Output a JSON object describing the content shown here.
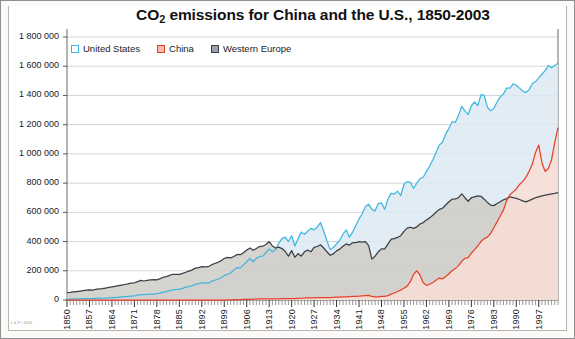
{
  "chart": {
    "title_main": "CO",
    "title_sub": "2",
    "title_rest": " emissions for China and the U.S., 1850-2003",
    "credit": "L & P / 2003"
  },
  "legend": {
    "items": [
      {
        "label": "United States",
        "color": "#3fb6e0",
        "key": "united-states"
      },
      {
        "label": "China",
        "color": "#e8412a",
        "key": "china"
      },
      {
        "label": "Western Europe",
        "color": "#3a3f46",
        "key": "western-europe"
      }
    ]
  },
  "axes": {
    "y_ticks": [
      "0",
      "200 000",
      "400 000",
      "600 000",
      "800 000",
      "1 000 000",
      "1 200 000",
      "1 400 000",
      "1 600 000",
      "1 800 000"
    ],
    "x_ticks": [
      "1850",
      "1857",
      "1864",
      "1871",
      "1878",
      "1885",
      "1892",
      "1899",
      "1906",
      "1913",
      "1920",
      "1927",
      "1934",
      "1941",
      "1948",
      "1955",
      "1962",
      "1969",
      "1976",
      "1983",
      "1990",
      "1997"
    ]
  },
  "chart_data": {
    "type": "area",
    "title": "CO2 emissions for China and the U.S., 1850-2003",
    "xlabel": "",
    "ylabel": "",
    "xlim": [
      1850,
      2003
    ],
    "ylim": [
      0,
      1800000
    ],
    "ytick_step": 200000,
    "xtick_step": 7,
    "grid": true,
    "legend_position": "top-left",
    "x": [
      1850,
      1851,
      1852,
      1853,
      1854,
      1855,
      1856,
      1857,
      1858,
      1859,
      1860,
      1861,
      1862,
      1863,
      1864,
      1865,
      1866,
      1867,
      1868,
      1869,
      1870,
      1871,
      1872,
      1873,
      1874,
      1875,
      1876,
      1877,
      1878,
      1879,
      1880,
      1881,
      1882,
      1883,
      1884,
      1885,
      1886,
      1887,
      1888,
      1889,
      1890,
      1891,
      1892,
      1893,
      1894,
      1895,
      1896,
      1897,
      1898,
      1899,
      1900,
      1901,
      1902,
      1903,
      1904,
      1905,
      1906,
      1907,
      1908,
      1909,
      1910,
      1911,
      1912,
      1913,
      1914,
      1915,
      1916,
      1917,
      1918,
      1919,
      1920,
      1921,
      1922,
      1923,
      1924,
      1925,
      1926,
      1927,
      1928,
      1929,
      1930,
      1931,
      1932,
      1933,
      1934,
      1935,
      1936,
      1937,
      1938,
      1939,
      1940,
      1941,
      1942,
      1943,
      1944,
      1945,
      1946,
      1947,
      1948,
      1949,
      1950,
      1951,
      1952,
      1953,
      1954,
      1955,
      1956,
      1957,
      1958,
      1959,
      1960,
      1961,
      1962,
      1963,
      1964,
      1965,
      1966,
      1967,
      1968,
      1969,
      1970,
      1971,
      1972,
      1973,
      1974,
      1975,
      1976,
      1977,
      1978,
      1979,
      1980,
      1981,
      1982,
      1983,
      1984,
      1985,
      1986,
      1987,
      1988,
      1989,
      1990,
      1991,
      1992,
      1993,
      1994,
      1995,
      1996,
      1997,
      1998,
      1999,
      2000,
      2001,
      2002,
      2003
    ],
    "series": [
      {
        "name": "United States",
        "color": "#3fb6e0",
        "fill": "#dce9f2",
        "values": [
          6000,
          6500,
          7000,
          7500,
          8500,
          9000,
          9500,
          10000,
          10500,
          11500,
          12500,
          12000,
          13000,
          14500,
          16000,
          17000,
          19000,
          21000,
          23000,
          25000,
          27000,
          29000,
          33000,
          37000,
          36000,
          38000,
          40000,
          41000,
          43000,
          47000,
          54000,
          58000,
          64000,
          70000,
          72000,
          73000,
          80000,
          88000,
          92000,
          98000,
          107000,
          112000,
          118000,
          118000,
          115000,
          127000,
          135000,
          142000,
          152000,
          168000,
          176000,
          185000,
          205000,
          222000,
          218000,
          240000,
          262000,
          285000,
          262000,
          285000,
          298000,
          300000,
          325000,
          350000,
          330000,
          345000,
          390000,
          420000,
          430000,
          400000,
          440000,
          370000,
          420000,
          465000,
          450000,
          470000,
          490000,
          480000,
          500000,
          530000,
          470000,
          405000,
          345000,
          360000,
          385000,
          410000,
          450000,
          480000,
          430000,
          465000,
          510000,
          555000,
          590000,
          640000,
          655000,
          620000,
          610000,
          660000,
          665000,
          620000,
          690000,
          730000,
          725000,
          745000,
          715000,
          790000,
          810000,
          805000,
          765000,
          800000,
          830000,
          840000,
          880000,
          915000,
          960000,
          1010000,
          1060000,
          1080000,
          1135000,
          1175000,
          1220000,
          1215000,
          1265000,
          1325000,
          1295000,
          1270000,
          1330000,
          1355000,
          1330000,
          1405000,
          1400000,
          1320000,
          1295000,
          1310000,
          1355000,
          1390000,
          1410000,
          1450000,
          1450000,
          1480000,
          1470000,
          1450000,
          1430000,
          1420000,
          1440000,
          1480000,
          1495000,
          1520000,
          1545000,
          1570000,
          1605000,
          1590000,
          1605000,
          1620000
        ]
      },
      {
        "name": "China",
        "color": "#e8412a",
        "fill": "#f9ded5",
        "values": [
          0,
          0,
          0,
          0,
          0,
          0,
          0,
          0,
          0,
          0,
          0,
          0,
          0,
          0,
          0,
          0,
          0,
          0,
          0,
          0,
          0,
          0,
          0,
          0,
          0,
          0,
          0,
          0,
          0,
          0,
          0,
          0,
          0,
          0,
          0,
          0,
          0,
          0,
          0,
          0,
          0,
          0,
          0,
          0,
          0,
          0,
          0,
          0,
          0,
          0,
          1000,
          1500,
          2000,
          2500,
          3000,
          3500,
          4000,
          5000,
          5500,
          6000,
          7000,
          7000,
          7500,
          8000,
          8000,
          8000,
          8500,
          9000,
          9000,
          9000,
          10000,
          10000,
          11000,
          12000,
          13000,
          14000,
          15000,
          15000,
          16000,
          17000,
          17000,
          17000,
          17000,
          18000,
          19000,
          20000,
          21000,
          22000,
          23000,
          24000,
          25000,
          26000,
          28000,
          30000,
          31000,
          24000,
          21000,
          22000,
          24000,
          25000,
          30000,
          40000,
          48000,
          58000,
          68000,
          80000,
          95000,
          125000,
          175000,
          200000,
          170000,
          118000,
          100000,
          108000,
          120000,
          135000,
          150000,
          145000,
          160000,
          180000,
          200000,
          215000,
          235000,
          265000,
          285000,
          290000,
          320000,
          345000,
          370000,
          400000,
          420000,
          430000,
          455000,
          495000,
          535000,
          575000,
          615000,
          680000,
          720000,
          740000,
          760000,
          790000,
          810000,
          840000,
          880000,
          930000,
          1010000,
          1060000,
          940000,
          880000,
          900000,
          960000,
          1080000,
          1180000
        ]
      },
      {
        "name": "Western Europe",
        "color": "#3a3f46",
        "fill": "#cfcdc6",
        "values": [
          50000,
          52000,
          55000,
          58000,
          61000,
          64000,
          67000,
          70000,
          68000,
          72000,
          76000,
          78000,
          82000,
          86000,
          90000,
          94000,
          98000,
          102000,
          106000,
          110000,
          115000,
          118000,
          126000,
          134000,
          130000,
          134000,
          138000,
          140000,
          138000,
          146000,
          156000,
          160000,
          168000,
          176000,
          176000,
          176000,
          182000,
          190000,
          198000,
          206000,
          218000,
          222000,
          228000,
          226000,
          228000,
          240000,
          250000,
          258000,
          268000,
          284000,
          292000,
          288000,
          298000,
          312000,
          310000,
          324000,
          342000,
          356000,
          340000,
          352000,
          366000,
          368000,
          380000,
          400000,
          370000,
          356000,
          362000,
          352000,
          332000,
          300000,
          338000,
          292000,
          318000,
          300000,
          330000,
          342000,
          330000,
          360000,
          366000,
          378000,
          356000,
          330000,
          306000,
          316000,
          336000,
          348000,
          368000,
          384000,
          376000,
          392000,
          392000,
          400000,
          396000,
          400000,
          372000,
          280000,
          300000,
          330000,
          350000,
          350000,
          382000,
          416000,
          420000,
          428000,
          440000,
          470000,
          492000,
          498000,
          490000,
          500000,
          520000,
          530000,
          548000,
          562000,
          580000,
          600000,
          620000,
          628000,
          650000,
          672000,
          690000,
          692000,
          700000,
          726000,
          700000,
          676000,
          700000,
          706000,
          712000,
          710000,
          690000,
          668000,
          650000,
          646000,
          660000,
          672000,
          686000,
          694000,
          706000,
          700000,
          696000,
          688000,
          678000,
          672000,
          680000,
          690000,
          700000,
          706000,
          712000,
          718000,
          722000,
          726000,
          730000,
          735000
        ]
      }
    ]
  }
}
